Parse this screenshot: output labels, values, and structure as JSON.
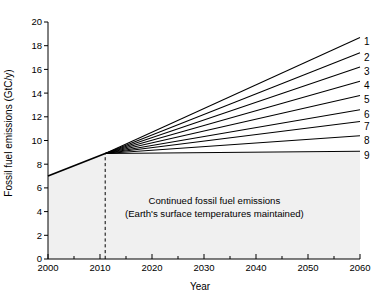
{
  "chart_data": {
    "type": "line",
    "title": "",
    "xlabel": "Year",
    "ylabel": "Fossil fuel emissions (GtC/y)",
    "xlim": [
      2000,
      2060
    ],
    "ylim": [
      0,
      20
    ],
    "xticks": [
      2000,
      2010,
      2020,
      2030,
      2040,
      2050,
      2060
    ],
    "xticklabels": [
      "2000",
      "2010",
      "2020",
      "2030",
      "2040",
      "2050",
      "2060"
    ],
    "xminorticks": [
      2005,
      2015,
      2025,
      2035,
      2045,
      2055
    ],
    "yticks": [
      0,
      2,
      4,
      6,
      8,
      10,
      12,
      14,
      16,
      18,
      20
    ],
    "yticklabels": [
      "0",
      "2",
      "4",
      "6",
      "8",
      "10",
      "12",
      "14",
      "16",
      "18",
      "20"
    ],
    "grid": false,
    "legend_position": "right-inline-endpoint-labels",
    "fill_color": "#f0f0f0",
    "line_color": "#000000",
    "historical": {
      "name": "historical emissions",
      "x": [
        2000,
        2011
      ],
      "values": [
        7.0,
        8.9
      ]
    },
    "branch_year": 2011,
    "branch_value": 8.9,
    "vertical_marker": {
      "year": 2011,
      "style": "dashed",
      "y_from": 0,
      "y_to": 8.9
    },
    "x": [
      2011,
      2060
    ],
    "series": [
      {
        "name": "1",
        "label": "1",
        "values": [
          8.9,
          18.7
        ]
      },
      {
        "name": "2",
        "label": "2",
        "values": [
          8.9,
          17.4
        ]
      },
      {
        "name": "3",
        "label": "3",
        "values": [
          8.9,
          16.2
        ]
      },
      {
        "name": "4",
        "label": "4",
        "values": [
          8.9,
          15.0
        ]
      },
      {
        "name": "5",
        "label": "5",
        "values": [
          8.9,
          13.8
        ]
      },
      {
        "name": "6",
        "label": "6",
        "values": [
          8.9,
          12.6
        ]
      },
      {
        "name": "7",
        "label": "7",
        "values": [
          8.9,
          11.6
        ]
      },
      {
        "name": "8",
        "label": "8",
        "values": [
          8.9,
          10.4
        ]
      },
      {
        "name": "9",
        "label": "9",
        "values": [
          8.9,
          9.1
        ]
      }
    ],
    "annotations": [
      {
        "name": "continued-emissions-note",
        "lines": [
          "Continued fossil fuel emissions",
          "(Earth's surface temperatures maintained)"
        ],
        "x": 2032,
        "y": 4.6
      }
    ]
  }
}
